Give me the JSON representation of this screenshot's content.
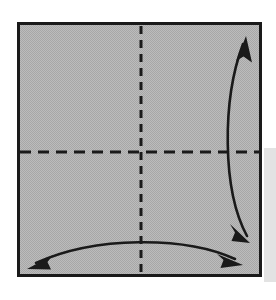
{
  "figure": {
    "title": "Origami fold step: square sheet with horizontal and vertical crease lines",
    "caption": "",
    "background_color": "#ffffff"
  },
  "canvas": {
    "width": 276,
    "height": 300
  },
  "paper": {
    "name": "square-sheet",
    "x": 17,
    "y": 22,
    "width": 245,
    "height": 255,
    "fill_color": "#b4b4b4",
    "stroke_color": "#1a1a1a",
    "stroke_width": 3
  },
  "shadow": {
    "name": "drop-shadow",
    "x": 264,
    "y": 148,
    "width": 12,
    "height": 134,
    "fill_color": "#e3e3e3"
  },
  "creases": [
    {
      "name": "vertical-crease-line",
      "orientation": "vertical",
      "x1": 141,
      "y1": 26,
      "x2": 141,
      "y2": 274,
      "style": "dashed",
      "dash": "8 6",
      "stroke_color": "#1a1a1a",
      "stroke_width": 3
    },
    {
      "name": "horizontal-crease-line",
      "orientation": "horizontal",
      "x1": 20,
      "y1": 152,
      "x2": 261,
      "y2": 152,
      "style": "dashed",
      "dash": "11 7",
      "stroke_color": "#1a1a1a",
      "stroke_width": 3
    }
  ],
  "arrows": [
    {
      "name": "right-fold-arrow",
      "description": "double-headed curved arrow along right edge indicating vertical fold",
      "path": "M 243 44 C 222 100, 222 190, 247 236",
      "stroke_color": "#1a1a1a",
      "stroke_width": 2.6,
      "heads": [
        {
          "name": "arrowhead-up",
          "tip_x": 246,
          "tip_y": 36,
          "direction": "up"
        },
        {
          "name": "arrowhead-down",
          "tip_x": 250,
          "tip_y": 243,
          "direction": "down"
        }
      ]
    },
    {
      "name": "bottom-fold-arrow",
      "description": "double-headed curved arrow along bottom edge indicating horizontal fold",
      "path": "M 36 263 C 95 236, 185 236, 235 259",
      "stroke_color": "#1a1a1a",
      "stroke_width": 2.6,
      "heads": [
        {
          "name": "arrowhead-left",
          "tip_x": 27,
          "tip_y": 269,
          "direction": "left"
        },
        {
          "name": "arrowhead-right",
          "tip_x": 243,
          "tip_y": 265,
          "direction": "right"
        }
      ]
    }
  ],
  "colors": {
    "paper_gray": "#b4b4b4",
    "ink_black": "#1a1a1a",
    "shadow_gray": "#e3e3e3",
    "page_white": "#ffffff"
  }
}
